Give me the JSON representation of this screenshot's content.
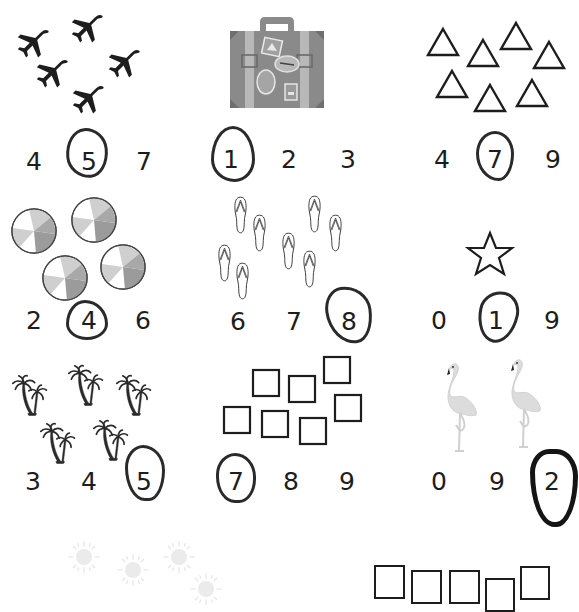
{
  "worksheet": {
    "title": "Count and circle the number",
    "colors": {
      "ink": "#1d1d1d",
      "pen": "#2a2a2a",
      "suitcase": "#8a8a8a",
      "suitcase_strap": "#b8b8b8",
      "beachball_dark": "#9b9b9b",
      "beachball_light": "#cfcfcf",
      "flamingo": "#dcdcdc",
      "sun": "#e6e6e6"
    },
    "problems": [
      {
        "id": "airplanes",
        "picture": "airplane-icon",
        "count": 5,
        "options": [
          "4",
          "5",
          "7"
        ],
        "circled": "5"
      },
      {
        "id": "suitcase",
        "picture": "suitcase-icon",
        "count": 1,
        "options": [
          "1",
          "2",
          "3"
        ],
        "circled": "1"
      },
      {
        "id": "triangles",
        "picture": "triangle-icon",
        "count": 7,
        "options": [
          "4",
          "7",
          "9"
        ],
        "circled": "7"
      },
      {
        "id": "beach-balls",
        "picture": "beach-ball-icon",
        "count": 4,
        "options": [
          "2",
          "4",
          "6"
        ],
        "circled": "4"
      },
      {
        "id": "flip-flops",
        "picture": "flip-flop-icon",
        "count": 8,
        "options": [
          "6",
          "7",
          "8"
        ],
        "circled": "8"
      },
      {
        "id": "star",
        "picture": "star-icon",
        "count": 1,
        "options": [
          "0",
          "1",
          "9"
        ],
        "circled": "1"
      },
      {
        "id": "palm-trees",
        "picture": "palm-tree-icon",
        "count": 5,
        "options": [
          "3",
          "4",
          "5"
        ],
        "circled": "5"
      },
      {
        "id": "squares",
        "picture": "square-icon",
        "count": 7,
        "options": [
          "7",
          "8",
          "9"
        ],
        "circled": "7"
      },
      {
        "id": "flamingos",
        "picture": "flamingo-icon",
        "count": 2,
        "options": [
          "0",
          "9",
          "2"
        ],
        "circled": "2"
      },
      {
        "id": "suns",
        "picture": "sun-icon",
        "count": null,
        "options": [],
        "circled": null,
        "partially_visible": true
      },
      {
        "id": "rectangles",
        "picture": "rectangle-icon",
        "count": null,
        "options": [],
        "circled": null,
        "partially_visible": true
      }
    ]
  }
}
